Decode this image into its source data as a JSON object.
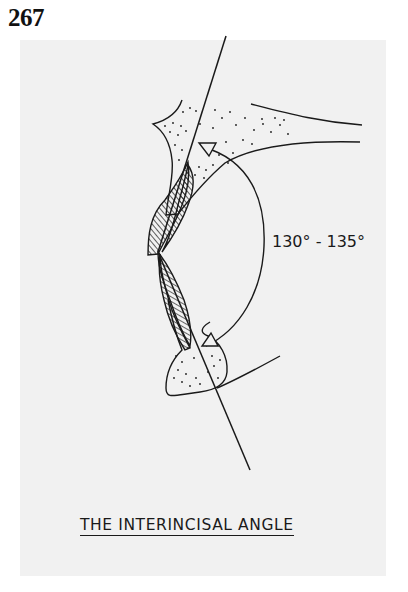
{
  "page": {
    "number": "267"
  },
  "figure": {
    "angle_label": "130° - 135°",
    "caption": "THE INTERINCISAL ANGLE",
    "panel_color": "#f1f1f1",
    "line_color": "#1a1a1a",
    "elements": [
      "upper-incisor-axis-line",
      "lower-incisor-axis-line",
      "upper-incisor-hatched",
      "lower-incisor-hatched",
      "upper-alveolar-bone-stippled",
      "lower-alveolar-bone-stippled",
      "palatal-plane-lines",
      "angle-arc",
      "upper-arrowhead",
      "lower-arrowhead"
    ]
  }
}
